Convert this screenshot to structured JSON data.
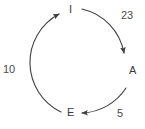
{
  "diagram": {
    "type": "cycle",
    "stroke_color": "#3f3f3f",
    "text_color": "#3b3b3b",
    "background": "#ffffff",
    "nodes": [
      {
        "id": "I",
        "label": "I",
        "x": 72,
        "y": 9
      },
      {
        "id": "A",
        "label": "A",
        "x": 133,
        "y": 70
      },
      {
        "id": "E",
        "label": "E",
        "x": 71,
        "y": 112
      }
    ],
    "edges": [
      {
        "from": "I",
        "to": "A",
        "label": "23",
        "direction": "clockwise"
      },
      {
        "from": "A",
        "to": "E",
        "label": "5",
        "direction": "clockwise"
      },
      {
        "from": "E",
        "to": "I",
        "label": "10",
        "direction": "clockwise"
      }
    ]
  }
}
